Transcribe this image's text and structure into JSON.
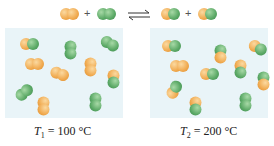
{
  "equation": {
    "reactants": [
      "orange-orange molecule",
      "green-green molecule"
    ],
    "products": [
      "orange-green molecule",
      "orange-green molecule"
    ],
    "plus": "+",
    "arrow": "equilibrium-arrows"
  },
  "colors": {
    "orange": "#f0a94e",
    "green": "#5aa865",
    "box": "#e9f4f8"
  },
  "panels": [
    {
      "label_var": "T",
      "label_sub": "1",
      "label_eq": "= 100 °C",
      "molecules": [
        {
          "x": 15,
          "y": 10,
          "a": "o",
          "b": "g",
          "rot": 0
        },
        {
          "x": 55,
          "y": 16,
          "a": "g",
          "b": "g",
          "rot": 90
        },
        {
          "x": 95,
          "y": 10,
          "a": "g",
          "b": "g",
          "rot": 30
        },
        {
          "x": 20,
          "y": 30,
          "a": "o",
          "b": "o",
          "rot": 0
        },
        {
          "x": 45,
          "y": 40,
          "a": "o",
          "b": "o",
          "rot": 20
        },
        {
          "x": 75,
          "y": 33,
          "a": "o",
          "b": "o",
          "rot": 90
        },
        {
          "x": 98,
          "y": 45,
          "a": "o",
          "b": "g",
          "rot": 90
        },
        {
          "x": 10,
          "y": 58,
          "a": "g",
          "b": "g",
          "rot": -40
        },
        {
          "x": 28,
          "y": 72,
          "a": "o",
          "b": "o",
          "rot": 90
        },
        {
          "x": 80,
          "y": 68,
          "a": "g",
          "b": "g",
          "rot": 90
        }
      ]
    },
    {
      "label_var": "T",
      "label_sub": "2",
      "label_eq": "= 200 °C",
      "molecules": [
        {
          "x": 12,
          "y": 12,
          "a": "o",
          "b": "g",
          "rot": 0
        },
        {
          "x": 60,
          "y": 20,
          "a": "g",
          "b": "o",
          "rot": 90
        },
        {
          "x": 98,
          "y": 14,
          "a": "o",
          "b": "g",
          "rot": 30
        },
        {
          "x": 20,
          "y": 32,
          "a": "o",
          "b": "o",
          "rot": 0
        },
        {
          "x": 50,
          "y": 40,
          "a": "o",
          "b": "g",
          "rot": 0
        },
        {
          "x": 80,
          "y": 35,
          "a": "o",
          "b": "g",
          "rot": 90
        },
        {
          "x": 103,
          "y": 47,
          "a": "g",
          "b": "o",
          "rot": 90
        },
        {
          "x": 15,
          "y": 55,
          "a": "o",
          "b": "g",
          "rot": -60
        },
        {
          "x": 35,
          "y": 72,
          "a": "o",
          "b": "g",
          "rot": 90
        },
        {
          "x": 85,
          "y": 68,
          "a": "g",
          "b": "g",
          "rot": 90
        }
      ]
    }
  ]
}
